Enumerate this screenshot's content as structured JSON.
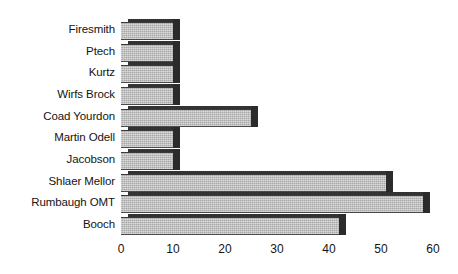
{
  "chart_data": {
    "type": "bar",
    "orientation": "horizontal",
    "title": "",
    "xlabel": "",
    "ylabel": "",
    "categories": [
      "Firesmith",
      "Ptech",
      "Kurtz",
      "Wirfs Brock",
      "Coad Yourdon",
      "Martin Odell",
      "Jacobson",
      "Shlaer Mellor",
      "Rumbaugh OMT",
      "Booch"
    ],
    "values": [
      10,
      10,
      10,
      10,
      25,
      10,
      10,
      51,
      58,
      42
    ],
    "xlim": [
      0,
      60
    ],
    "xticks": [
      0,
      10,
      20,
      30,
      40,
      50,
      60
    ],
    "xtick_labels": [
      "0",
      "10",
      "20",
      "30",
      "40",
      "50",
      "60"
    ],
    "grid": false,
    "legend": false,
    "style": "3d-grayscale",
    "bar_color": "#b9b9b9",
    "bar_edge_color": "#2b2b2b"
  }
}
